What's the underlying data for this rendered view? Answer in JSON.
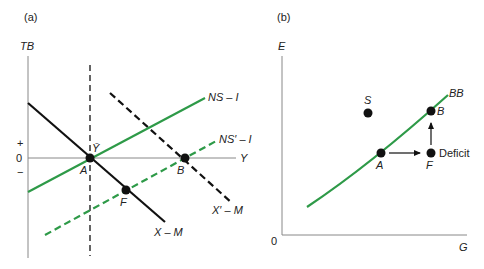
{
  "colors": {
    "green": "#2e9a48",
    "black": "#111111",
    "axis": "#888888"
  },
  "panel_a": {
    "label": "(a)",
    "y_axis_label": "TB",
    "x_axis_label": "Y",
    "plus_sign": "+",
    "zero": "0",
    "minus_sign": "−",
    "y_bar_label": "Ȳ",
    "curves": {
      "ns_i": "NS – I",
      "ns_prime_i": "NS′ – I",
      "x_m": "X – M",
      "x_prime_m": "X′ – M"
    },
    "points": {
      "a": "A",
      "b": "B",
      "f": "F"
    }
  },
  "panel_b": {
    "label": "(b)",
    "y_axis_label": "E",
    "x_axis_label": "G",
    "origin": "0",
    "curve": "BB",
    "points": {
      "s": "S",
      "b": "B",
      "a": "A",
      "f": "F"
    },
    "deficit_label": "Deficit"
  }
}
